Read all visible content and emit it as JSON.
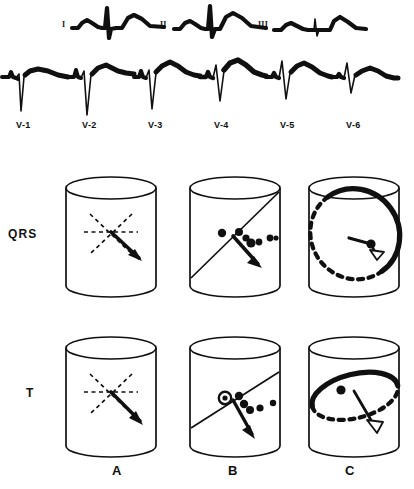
{
  "figure": {
    "type": "ecg-and-vector-loop-diagram",
    "background": "#ffffff",
    "ink": "#101010"
  },
  "ecg": {
    "limb_leads": [
      {
        "label": "I",
        "label_x": 62,
        "label_y": 26,
        "x": 72,
        "y": 4,
        "width": 88,
        "height": 44,
        "r_amplitude": "medium",
        "t_amplitude": "medium",
        "description": "small P, narrow tall R, small S, broad upright T"
      },
      {
        "label": "II",
        "label_x": 160,
        "label_y": 26,
        "x": 172,
        "y": 4,
        "width": 88,
        "height": 44,
        "r_amplitude": "tall",
        "t_amplitude": "medium",
        "description": "small P, tallest R of limb leads, broad upright T"
      },
      {
        "label": "III",
        "label_x": 258,
        "label_y": 26,
        "x": 272,
        "y": 4,
        "width": 88,
        "height": 44,
        "r_amplitude": "small",
        "t_amplitude": "medium",
        "description": "near isoelectric small QRS, broad upright T"
      }
    ],
    "precordial_leads": [
      {
        "label": "V-1",
        "label_x": 21,
        "label_y": 126,
        "x": 4,
        "y": 58,
        "width": 62,
        "height": 62,
        "pattern": "rS",
        "description": "small r, deep S, flat low T"
      },
      {
        "label": "V-2",
        "label_x": 89,
        "label_y": 126,
        "x": 70,
        "y": 58,
        "width": 62,
        "height": 62,
        "pattern": "rS",
        "description": "small r, deepest S, raised broad T"
      },
      {
        "label": "V-3",
        "label_x": 157,
        "label_y": 126,
        "x": 136,
        "y": 58,
        "width": 62,
        "height": 62,
        "pattern": "rS",
        "description": "small r, deep S, tall broad T"
      },
      {
        "label": "V-4",
        "label_x": 225,
        "label_y": 126,
        "x": 202,
        "y": 58,
        "width": 62,
        "height": 62,
        "pattern": "RS",
        "description": "taller R, moderate S, tall broad T"
      },
      {
        "label": "V-5",
        "label_x": 293,
        "label_y": 126,
        "x": 268,
        "y": 58,
        "width": 62,
        "height": 62,
        "pattern": "Rs",
        "description": "tall R, small S, broad upright T"
      },
      {
        "label": "V-6",
        "label_x": 361,
        "label_y": 126,
        "x": 334,
        "y": 58,
        "width": 62,
        "height": 62,
        "pattern": "Rs",
        "description": "tall narrow R, small s, lower broad T"
      }
    ]
  },
  "panels": {
    "row_labels": [
      {
        "text": "QRS",
        "x": 8,
        "y": 227
      },
      {
        "text": "T",
        "x": 26,
        "y": 386
      }
    ],
    "column_labels": [
      {
        "text": "A",
        "x": 112,
        "y": 466
      },
      {
        "text": "B",
        "x": 228,
        "y": 466
      },
      {
        "text": "C",
        "x": 345,
        "y": 466
      }
    ],
    "cylinders": [
      {
        "row": "QRS",
        "col": "A",
        "x": 62,
        "y": 170,
        "w": 96,
        "h": 132,
        "content": "three dashed reference axes crossing at centre with solid vector arrow aimed lower-right"
      },
      {
        "row": "QRS",
        "col": "B",
        "x": 186,
        "y": 170,
        "w": 96,
        "h": 132,
        "content": "steep solid diagonal wavefront line with row of filled dots and solid vector arrow aimed lower-right"
      },
      {
        "row": "QRS",
        "col": "C",
        "x": 305,
        "y": 170,
        "w": 96,
        "h": 132,
        "content": "tilted loop, bold solid lower-right arc and dashed upper-left arc, short vector with hollow arrowhead"
      },
      {
        "row": "T",
        "col": "A",
        "x": 62,
        "y": 330,
        "w": 96,
        "h": 132,
        "content": "three dashed reference axes crossing at centre with solid vector arrow aimed lower-right"
      },
      {
        "row": "T",
        "col": "B",
        "x": 186,
        "y": 330,
        "w": 96,
        "h": 132,
        "content": "shallow solid diagonal wavefront line, ringed origin dot plus filled dots, steep solid vector arrow"
      },
      {
        "row": "T",
        "col": "C",
        "x": 305,
        "y": 330,
        "w": 96,
        "h": 132,
        "content": "flattened loop, bold solid upper arc and dashed lower arc, dot on loop, vector with hollow arrowhead"
      }
    ]
  }
}
